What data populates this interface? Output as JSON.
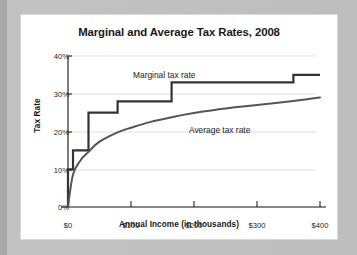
{
  "chart_data": {
    "type": "line",
    "title": "Marginal and Average Tax Rates, 2008",
    "xlabel": "Annual Income (in thousands)",
    "ylabel": "Tax Rate",
    "xlim": [
      0,
      430
    ],
    "ylim": [
      0,
      40
    ],
    "xticks": [
      0,
      100,
      200,
      300,
      400
    ],
    "xticklabels": [
      "$0",
      "$100",
      "$200",
      "$300",
      "$400"
    ],
    "yticks": [
      0,
      10,
      20,
      30,
      40
    ],
    "yticklabels": [
      "0%",
      "10%",
      "20%",
      "30%",
      "40%"
    ],
    "grid": "horizontal",
    "legend": "inline-annotations",
    "annotations": [
      {
        "text": "Marginal tax rate",
        "x": 120,
        "y": 37
      },
      {
        "text": "Average tax rate",
        "x": 215,
        "y": 23
      }
    ],
    "series": [
      {
        "name": "Marginal tax rate",
        "style": "step",
        "brackets": [
          {
            "income_start": 0,
            "income_end": 8,
            "rate": 10
          },
          {
            "income_start": 8,
            "income_end": 32.5,
            "rate": 15
          },
          {
            "income_start": 32.5,
            "income_end": 78.8,
            "rate": 25
          },
          {
            "income_start": 78.8,
            "income_end": 164.5,
            "rate": 28
          },
          {
            "income_start": 164.5,
            "income_end": 357.7,
            "rate": 33
          },
          {
            "income_start": 357.7,
            "income_end": 400,
            "rate": 35
          }
        ]
      },
      {
        "name": "Average tax rate",
        "style": "smooth",
        "x": [
          0,
          8,
          20,
          32.5,
          50,
          78.8,
          100,
          130,
          164.5,
          200,
          250,
          300,
          357.7,
          400
        ],
        "values": [
          0,
          8.6,
          12.4,
          14.6,
          17.3,
          19.8,
          21.0,
          22.5,
          23.8,
          24.9,
          26.1,
          27.0,
          28.1,
          29.0
        ]
      }
    ]
  },
  "colors": {
    "page_background": "#bcbcbc",
    "card_background": "#ffffff",
    "marginal_line": "#333333",
    "average_line": "#555555",
    "gridline": "#d2d2d2",
    "axis": "#111111",
    "text": "#1a1a1a"
  }
}
